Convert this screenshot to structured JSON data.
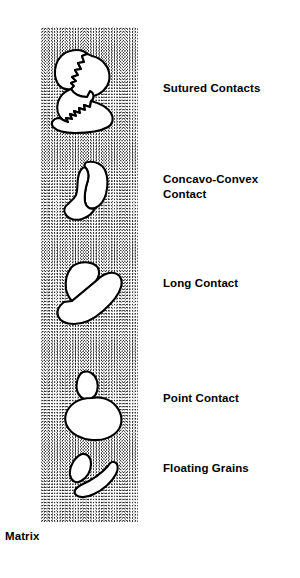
{
  "figure": {
    "width": 300,
    "height": 578,
    "background_color": "#ffffff",
    "line_color": "#000000",
    "grain_fill_color": "#ffffff",
    "matrix_stipple_color": "#333333"
  },
  "matrix": {
    "label": "Matrix",
    "description": "Fine random stipple pattern column",
    "bounds": {
      "x": 41,
      "y": 27,
      "width": 97,
      "height": 495
    }
  },
  "labels": [
    {
      "id": "sutured",
      "text": "Sutured Contacts",
      "lines": [
        "Sutured Contacts"
      ],
      "x": 163,
      "y": 81
    },
    {
      "id": "concavo-convex",
      "text": "Concavo-Convex\nContact",
      "lines": [
        "Concavo-Convex",
        "Contact"
      ],
      "x": 163,
      "y": 172
    },
    {
      "id": "long",
      "text": "Long Contact",
      "lines": [
        "Long Contact"
      ],
      "x": 163,
      "y": 276
    },
    {
      "id": "point",
      "text": "Point Contact",
      "lines": [
        "Point Contact"
      ],
      "x": 163,
      "y": 391
    },
    {
      "id": "floating",
      "text": "Floating Grains",
      "lines": [
        "Floating Grains"
      ],
      "x": 163,
      "y": 461
    }
  ],
  "grain_groups": [
    {
      "id": "sutured",
      "label": "Sutured Contacts",
      "grain_count": 3,
      "center": {
        "x": 88,
        "y": 86
      },
      "contact_style": "interlocking jagged sutured boundaries"
    },
    {
      "id": "concavo-convex",
      "label": "Concavo-Convex Contact",
      "grain_count": 2,
      "center": {
        "x": 90,
        "y": 190
      },
      "contact_style": "concave grain wrapping convex grain"
    },
    {
      "id": "long",
      "label": "Long Contact",
      "grain_count": 2,
      "center": {
        "x": 88,
        "y": 293
      },
      "contact_style": "extended straight planar contact"
    },
    {
      "id": "point",
      "label": "Point Contact",
      "grain_count": 2,
      "center": {
        "x": 92,
        "y": 399
      },
      "contact_style": "tangential single point touch"
    },
    {
      "id": "floating",
      "label": "Floating Grains",
      "grain_count": 2,
      "center": {
        "x": 92,
        "y": 474
      },
      "contact_style": "no grain contact, fully matrix supported"
    }
  ]
}
